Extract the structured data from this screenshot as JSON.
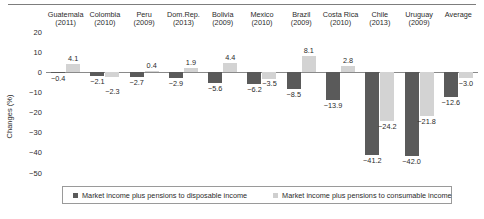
{
  "axis": {
    "ylabel": "Changes (%)",
    "yticks": [
      "20",
      "10",
      "0",
      "-10",
      "-20",
      "-30",
      "-40",
      "-50"
    ]
  },
  "legend": {
    "items": [
      {
        "swatch": "dark",
        "label": "Market income plus pensions to disposable income"
      },
      {
        "swatch": "light",
        "label": "Market income plus pensions to consumable income"
      }
    ]
  },
  "colors": {
    "series_disposable": "#5a5a5a",
    "series_consumable": "#d3d3d3",
    "axis": "#8a8a8a",
    "text": "#2b2b2b"
  },
  "chart_data": {
    "type": "bar",
    "title": "",
    "xlabel": "",
    "ylabel": "Changes (%)",
    "ylim": [
      -50,
      20
    ],
    "ytick_step": 10,
    "grid": false,
    "legend_position": "bottom",
    "categories": [
      "Guatemala (2011)",
      "Colombia (2010)",
      "Peru (2009)",
      "Dom.Rep. (2013)",
      "Bolivia (2009)",
      "Mexico (2010)",
      "Brazil (2009)",
      "Costa Rica (2010)",
      "Chile (2013)",
      "Uruguay (2009)",
      "Average"
    ],
    "category_lines": [
      [
        "Guatemala",
        "(2011)"
      ],
      [
        "Colombia",
        "(2010)"
      ],
      [
        "Peru",
        "(2009)"
      ],
      [
        "Dom.Rep.",
        "(2013)"
      ],
      [
        "Bolivia",
        "(2009)"
      ],
      [
        "Mexico",
        "(2010)"
      ],
      [
        "Brazil",
        "(2009)"
      ],
      [
        "Costa Rica",
        "(2010)"
      ],
      [
        "Chile",
        "(2013)"
      ],
      [
        "Uruguay",
        "(2009)"
      ],
      [
        "Average",
        ""
      ]
    ],
    "series": [
      {
        "name": "Market income plus pensions to disposable income",
        "color": "#5a5a5a",
        "values": [
          -0.4,
          -2.1,
          -2.7,
          -2.9,
          -5.6,
          -6.2,
          -8.5,
          -13.9,
          -41.2,
          -42.0,
          -12.6
        ],
        "labels": [
          "-0.4",
          "-2.1",
          "-2.7",
          "-2.9",
          "-5.6",
          "-6.2",
          "-8.5",
          "-13.9",
          "-41.2",
          "-42.0",
          "-12.6"
        ]
      },
      {
        "name": "Market income plus pensions to consumable income",
        "color": "#d3d3d3",
        "values": [
          4.1,
          -2.3,
          0.4,
          1.9,
          4.4,
          -3.5,
          8.1,
          2.8,
          -24.2,
          -21.8,
          -3.0
        ],
        "labels": [
          "4.1",
          "-2.3",
          "0.4",
          "1.9",
          "4.4",
          "-3.5",
          "8.1",
          "2.8",
          "-24.2",
          "-21.8",
          "-3.0"
        ]
      }
    ]
  }
}
